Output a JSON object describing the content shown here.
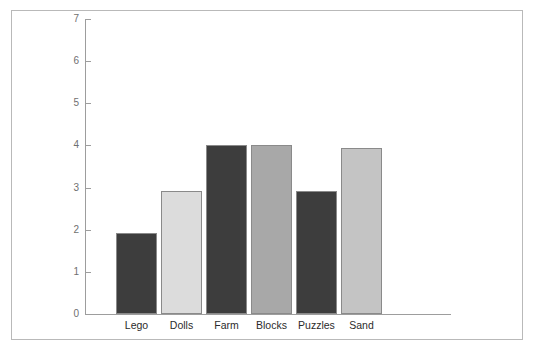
{
  "chart_data": {
    "type": "bar",
    "title": "",
    "subtitle": "",
    "xlabel": "",
    "ylabel": "",
    "categories": [
      "Lego",
      "Dolls",
      "Farm",
      "Blocks",
      "Puzzles",
      "Sand"
    ],
    "values": [
      1.92,
      2.92,
      4.0,
      4.0,
      2.92,
      3.95
    ],
    "series": [
      {
        "name": "Count",
        "values": [
          1.92,
          2.92,
          4.0,
          4.0,
          2.92,
          3.95
        ]
      }
    ],
    "bar_colors": [
      "#3d3d3d",
      "#dcdcdc",
      "#3d3d3d",
      "#a8a8a8",
      "#3d3d3d",
      "#c4c4c4"
    ],
    "bar_border_color": "#8a8a8a",
    "ylim": [
      0,
      7
    ],
    "ytick_values": [
      0,
      1,
      2,
      3,
      4,
      5,
      6,
      7
    ],
    "ytick_labels": [
      "0",
      "1",
      "2",
      "3",
      "4",
      "5",
      "6",
      "7"
    ],
    "grid": false,
    "legend": false,
    "legend_position": "none",
    "axis_color": "#9d9d9d",
    "tick_label_color": "#6f6f6f",
    "category_label_color": "#2b2b2b",
    "frame_border_color": "#b9b9b9",
    "background": "#ffffff"
  },
  "top_clipped_glyphs": {
    "left": "",
    "right": ""
  }
}
